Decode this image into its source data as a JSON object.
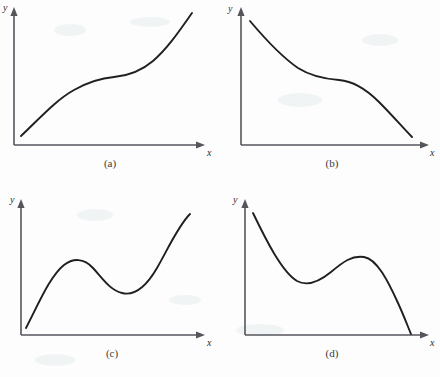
{
  "figure": {
    "background_color": "#fdfdfd",
    "curve_color": "#1f1f1f",
    "axis_color": "#55555c",
    "width": 440,
    "height": 377
  },
  "panels": [
    {
      "caption": "(a)",
      "x_axis_label": "x",
      "y_axis_label": "y",
      "description": "increasing curve with inflection point",
      "caption_x": 110,
      "caption_y": 167,
      "origin_x": 14,
      "origin_y": 145,
      "x_axis_end": 205,
      "y_axis_top": 10,
      "x_label_x": 207,
      "x_label_y": 156,
      "y_label_x": 3,
      "y_label_y": 11,
      "curve_path": "M 21 136 C 40 118, 56 100, 74 90 C 90 81, 102 78, 114 77 C 126 76, 140 72, 153 61 C 168 48, 180 30, 192 13"
    },
    {
      "caption": "(b)",
      "x_axis_label": "x",
      "y_axis_label": "y",
      "description": "decreasing curve with inflection point",
      "caption_x": 332,
      "caption_y": 167,
      "origin_x": 241,
      "origin_y": 145,
      "x_axis_end": 429,
      "y_axis_top": 10,
      "x_label_x": 430,
      "x_label_y": 156,
      "y_label_x": 228,
      "y_label_y": 12,
      "curve_path": "M 250 21 C 266 40, 282 57, 298 68 C 312 77, 326 79, 339 80 C 352 81, 365 88, 379 102 C 393 116, 404 129, 412 137"
    },
    {
      "caption": "(c)",
      "x_axis_label": "x",
      "y_axis_label": "y",
      "description": "cubic curve with local maximum then local minimum, rising",
      "caption_x": 112,
      "caption_y": 357,
      "origin_x": 21,
      "origin_y": 335,
      "x_axis_end": 205,
      "y_axis_top": 202,
      "x_label_x": 207,
      "x_label_y": 346,
      "y_label_x": 10,
      "y_label_y": 203,
      "curve_path": "M 26 328 C 38 305, 50 276, 64 265 C 73 258, 84 258, 93 268 C 103 279, 110 290, 122 293 C 134 296, 146 287, 157 268 C 168 249, 178 226, 190 214"
    },
    {
      "caption": "(d)",
      "x_axis_label": "x",
      "y_axis_label": "y",
      "description": "curve falling to local minimum, rising to local maximum, then falling",
      "caption_x": 332,
      "caption_y": 357,
      "origin_x": 245,
      "origin_y": 335,
      "x_axis_end": 429,
      "y_axis_top": 202,
      "x_label_x": 430,
      "x_label_y": 346,
      "y_label_x": 233,
      "y_label_y": 203,
      "curve_path": "M 253 213 C 266 240, 282 272, 297 281 C 308 287, 320 281, 331 272 C 343 262, 352 255, 364 257 C 377 259, 388 281, 398 303 C 404 316, 408 327, 411 334"
    }
  ]
}
